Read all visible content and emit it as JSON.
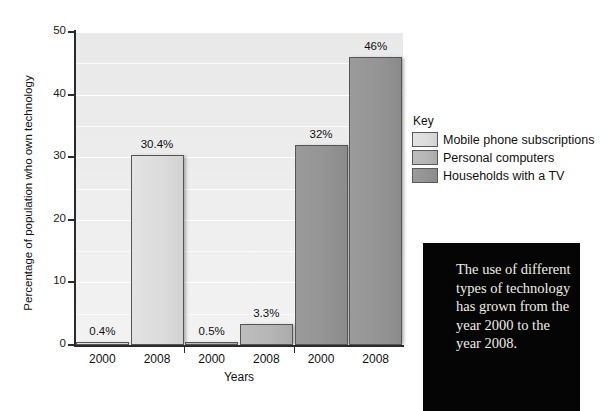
{
  "chart_data": {
    "type": "bar",
    "title": "",
    "xlabel": "Years",
    "ylabel": "Percentage of population who own technology",
    "ylim": [
      0,
      50
    ],
    "yticks": [
      0,
      10,
      20,
      30,
      40,
      50
    ],
    "ytick_labels": [
      "0",
      "10",
      "20",
      "30",
      "40",
      "50"
    ],
    "gridlines_minor": [
      5,
      15,
      25,
      35,
      45
    ],
    "grid": true,
    "legend_position": "right",
    "categories": [
      "2000",
      "2008"
    ],
    "series": [
      {
        "name": "Mobile phone subscriptions",
        "color": "#dcdcdc",
        "values": [
          0.4,
          30.4
        ],
        "labels": [
          "0.4%",
          "30.4%"
        ]
      },
      {
        "name": "Personal computers",
        "color": "#b6b6b6",
        "values": [
          0.5,
          3.3
        ],
        "labels": [
          "0.5%",
          "3.3%"
        ]
      },
      {
        "name": "Households with a TV",
        "color": "#949494",
        "values": [
          32,
          46
        ],
        "labels": [
          "32%",
          "46%"
        ]
      }
    ],
    "xtick_labels": [
      "2000",
      "2008",
      "2000",
      "2008",
      "2000",
      "2008"
    ]
  },
  "legend": {
    "title": "Key",
    "items": [
      {
        "label": "Mobile phone subscriptions"
      },
      {
        "label": "Personal computers"
      },
      {
        "label": "Households with a TV"
      }
    ]
  },
  "callout": {
    "text": "The use of different types of technology has grown from the year 2000 to the year 2008."
  },
  "colors": {
    "series_1": "#dcdcdc",
    "series_2": "#b6b6b6",
    "series_3": "#949494",
    "plot_background": "#ececec",
    "axis": "#2b2b2b",
    "callout_background": "#050505",
    "callout_text": "#f0ece4"
  }
}
